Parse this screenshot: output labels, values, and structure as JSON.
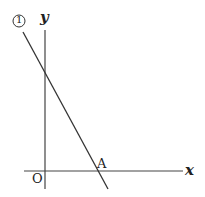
{
  "diagram": {
    "type": "coordinate-plane",
    "axes": {
      "x_label": "x",
      "y_label": "y",
      "origin_label": "O"
    },
    "line": {
      "label": "①",
      "description": "decreasing line with positive y-intercept"
    },
    "points": [
      {
        "label": "A",
        "description": "x-intercept of line ①"
      }
    ],
    "colors": {
      "stroke": "#333333",
      "text": "#222222",
      "background": "#ffffff"
    }
  }
}
